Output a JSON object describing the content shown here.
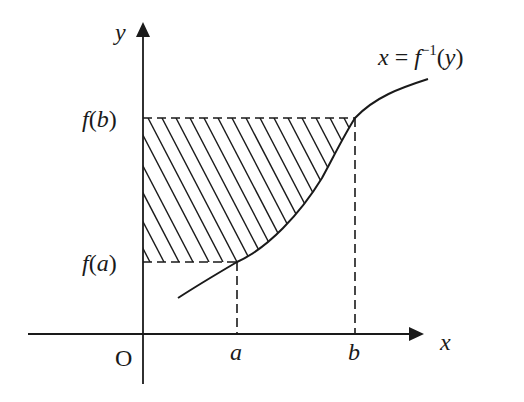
{
  "diagram": {
    "title": "",
    "type": "area-under-inverse-function",
    "colors": {
      "ink": "#1a1a1a",
      "background": "#ffffff"
    },
    "axes": {
      "x_label": "x",
      "y_label": "y",
      "origin_label": "O"
    },
    "x_ticks": [
      {
        "label": "a"
      },
      {
        "label": "b"
      }
    ],
    "y_ticks": [
      {
        "label_prefix": "f(",
        "label_arg": "a",
        "label_suffix": ")"
      },
      {
        "label_prefix": "f(",
        "label_arg": "b",
        "label_suffix": ")"
      }
    ],
    "curve_label": {
      "lhs": "x = f",
      "sup": "−1",
      "rhs": "(y)"
    },
    "shaded_region": "Region between y-axis and curve x = f⁻¹(y) for f(a) ≤ y ≤ f(b), hatched with diagonal lines"
  }
}
